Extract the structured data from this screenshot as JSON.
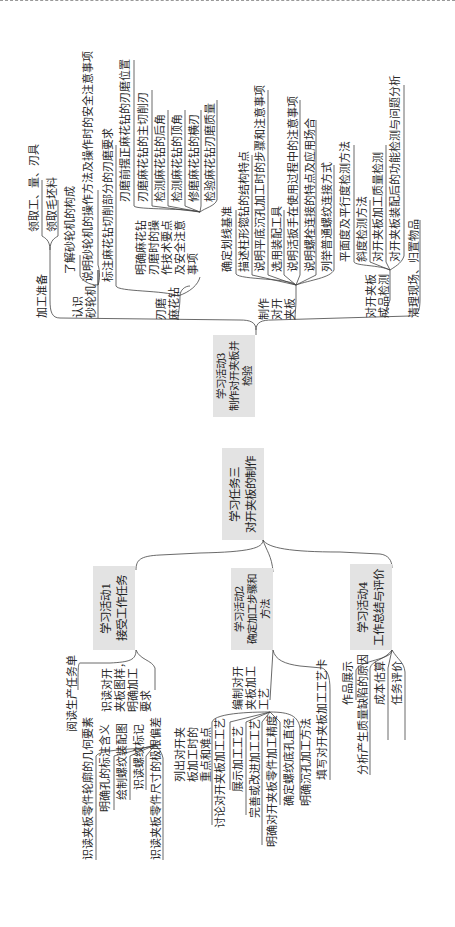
{
  "root": {
    "label": "学习任务三\n对开夹板的制作"
  },
  "activities": [
    {
      "label": "学习活动1\n接受工作任务"
    },
    {
      "label": "学习活动2\n确定加工步骤和\n方法"
    },
    {
      "label": "学习活动3\n制作对开夹板并\n检验"
    },
    {
      "label": "学习活动4\n工作总结与评价"
    }
  ],
  "a1": {
    "read_task": "阅读生产任务单",
    "read_drawing": "识读对开\n夹板图样，\n明确加工\n要求",
    "items": [
      "识读夹板零件轮廓的几何要素",
      "明确孔的标注含义",
      "绘制螺纹装配图",
      "识读螺纹标记",
      "识读夹板零件尺寸的极限偏差"
    ]
  },
  "a2": {
    "list_points": "列出对开夹\n板加工时的\n重点和难点",
    "compile": "编制对开\n夹板加工\n工艺",
    "items": [
      "讨论对开夹板加工工艺",
      "展示加工工艺",
      "完善或改进加工工艺",
      "明确对开夹板零件加工精度",
      "确定螺纹底孔直径",
      "明确沉孔加工方法"
    ],
    "fill_card": "填写对开夹板加工工艺卡"
  },
  "a3": {
    "prep": "加工准备",
    "prep_items": [
      "领取工、量、刃具",
      "领取毛坯料"
    ],
    "grinder": "认识\n砂轮机",
    "grinder_items": [
      "了解砂轮机的构成",
      "说明砂轮机的操作方法及操作时的安全注意事项"
    ],
    "sharpen": "刃磨\n麻花钻",
    "sharpen_mark": "标注麻花钻切削部分的刃磨要求",
    "sharpen_tech": "明确麻花钻\n刃磨时的操\n作技术要点\n及安全注意\n事项",
    "sharpen_items": [
      "刃磨前摆正麻花钻的刃磨位置",
      "刃磨麻花钻的主切削刃",
      "检测麻花钻的后角",
      "检测麻花钻的顶角",
      "修磨麻花钻的横刃",
      "检验麻花钻刃磨质量"
    ],
    "make": "制作\n对开\n夹板",
    "make_items": [
      "确定划线基准",
      "描述柱形锪钻的结构特点",
      "说明平底沉孔加工时的步骤和注意事项",
      "选用装配工具",
      "说明活扳手在使用过程中的注意事项",
      "说明螺栓连接的特点及应用场合",
      "列举普通螺纹连接方式"
    ],
    "inspect": "对开夹板\n成品检测",
    "inspect_items": [
      "平面度及平行度检测方法",
      "斜度检测方法",
      "对开夹板加工质量检测",
      "对开夹板装配后的功能检测与问题分析"
    ],
    "cleanup": "清理现场、归置物品"
  },
  "a4": {
    "items": [
      "作品展示",
      "分析产生质量缺陷的原因",
      "成本估算",
      "任务评价"
    ]
  }
}
